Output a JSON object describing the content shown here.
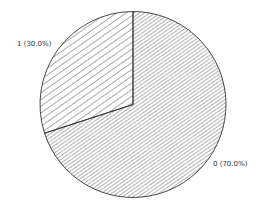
{
  "chart_data": {
    "type": "pie",
    "title": "",
    "categories": [
      "0",
      "1"
    ],
    "values": [
      70.0,
      30.0
    ],
    "labels": [
      "0 (70.0%)",
      "1 (30.0%)"
    ],
    "start_angle": "12 o'clock",
    "direction": "counterclockwise for slice 1",
    "fill_style": [
      "dense diagonal hatch",
      "sparse diagonal hatch"
    ],
    "legend": "none",
    "colors": {
      "stroke": "#333333",
      "hatch": "#555555",
      "background": "#ffffff"
    }
  }
}
